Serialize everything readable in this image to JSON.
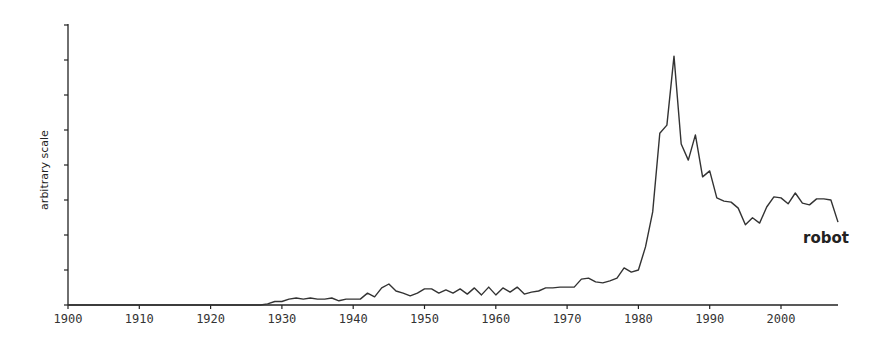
{
  "chart_data": {
    "type": "line",
    "title": "",
    "xlabel": "",
    "ylabel": "arbitrary scale",
    "xlim": [
      1900,
      2008
    ],
    "ylim": [
      0,
      8
    ],
    "grid": false,
    "legend": "inline label at end of series",
    "x_ticks": [
      1900,
      1910,
      1920,
      1930,
      1940,
      1950,
      1960,
      1970,
      1980,
      1990,
      2000
    ],
    "y_tick_count": 9,
    "series": [
      {
        "name": "robot",
        "color": "#333333",
        "x": [
          1900,
          1927,
          1928,
          1929,
          1930,
          1931,
          1932,
          1933,
          1934,
          1935,
          1936,
          1937,
          1938,
          1939,
          1940,
          1941,
          1942,
          1943,
          1944,
          1945,
          1946,
          1947,
          1948,
          1949,
          1950,
          1951,
          1952,
          1953,
          1954,
          1955,
          1956,
          1957,
          1958,
          1959,
          1960,
          1961,
          1962,
          1963,
          1964,
          1965,
          1966,
          1967,
          1968,
          1969,
          1970,
          1971,
          1972,
          1973,
          1974,
          1975,
          1976,
          1977,
          1978,
          1979,
          1980,
          1981,
          1982,
          1983,
          1984,
          1985,
          1986,
          1987,
          1988,
          1989,
          1990,
          1991,
          1992,
          1993,
          1994,
          1995,
          1996,
          1997,
          1998,
          1999,
          2000,
          2001,
          2002,
          2003,
          2004,
          2005,
          2006,
          2007,
          2008
        ],
        "values": [
          0,
          0,
          0.03,
          0.1,
          0.1,
          0.17,
          0.2,
          0.17,
          0.2,
          0.17,
          0.17,
          0.2,
          0.12,
          0.17,
          0.17,
          0.17,
          0.34,
          0.23,
          0.49,
          0.6,
          0.4,
          0.34,
          0.26,
          0.34,
          0.46,
          0.46,
          0.34,
          0.43,
          0.34,
          0.46,
          0.31,
          0.49,
          0.29,
          0.51,
          0.29,
          0.49,
          0.37,
          0.51,
          0.31,
          0.37,
          0.4,
          0.49,
          0.49,
          0.51,
          0.51,
          0.51,
          0.74,
          0.77,
          0.66,
          0.63,
          0.69,
          0.77,
          1.06,
          0.94,
          1.0,
          1.66,
          2.66,
          4.91,
          5.14,
          7.11,
          4.6,
          4.14,
          4.86,
          3.66,
          3.83,
          3.06,
          2.97,
          2.94,
          2.77,
          2.29,
          2.49,
          2.34,
          2.8,
          3.09,
          3.06,
          2.89,
          3.2,
          2.91,
          2.86,
          3.03,
          3.03,
          3.0,
          2.37
        ]
      }
    ]
  },
  "axes": {
    "ylabel": "arbitrary scale",
    "x_tick_labels": [
      "1900",
      "1910",
      "1920",
      "1930",
      "1940",
      "1950",
      "1960",
      "1970",
      "1980",
      "1990",
      "2000"
    ]
  },
  "series_label": "robot"
}
